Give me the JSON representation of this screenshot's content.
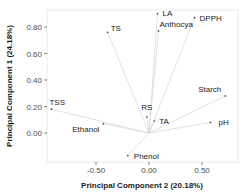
{
  "chart_data": {
    "type": "scatter",
    "subtype": "pca-loading-biplot",
    "title": "",
    "xlabel": "Principal Component 2 (20.18%)",
    "ylabel": "Principal Component 1 (24.18%)",
    "xlim": [
      -0.98,
      0.84
    ],
    "ylim": [
      -0.22,
      0.93
    ],
    "xticks": [
      -0.5,
      0.0,
      0.5
    ],
    "xtick_labels": [
      "-0.50",
      "0.00",
      "0.50"
    ],
    "yticks": [
      0.0,
      0.2,
      0.4,
      0.6,
      0.8
    ],
    "ytick_labels": [
      "0.00",
      "0.20",
      "0.40",
      "0.60",
      "0.80"
    ],
    "grid": false,
    "legend": null,
    "vectors_from_origin": true,
    "points": [
      {
        "label": "TS",
        "x": -0.39,
        "y": 0.76,
        "label_dx": 3,
        "label_dy": -1,
        "anchor": "start"
      },
      {
        "label": "LA",
        "x": 0.08,
        "y": 0.9,
        "label_dx": 5,
        "label_dy": 2,
        "anchor": "start"
      },
      {
        "label": "Anthocya",
        "x": 0.09,
        "y": 0.77,
        "label_dx": 1,
        "label_dy": -4,
        "anchor": "start"
      },
      {
        "label": "DPPH",
        "x": 0.43,
        "y": 0.87,
        "label_dx": 5,
        "label_dy": 3,
        "anchor": "start"
      },
      {
        "label": "TSS",
        "x": -0.92,
        "y": 0.18,
        "label_dx": -2,
        "label_dy": -4,
        "anchor": "start"
      },
      {
        "label": "Ethanol",
        "x": -0.43,
        "y": 0.07,
        "label_dx": -4,
        "label_dy": 8,
        "anchor": "end"
      },
      {
        "label": "RS",
        "x": -0.02,
        "y": 0.12,
        "label_dx": 0,
        "label_dy": -7,
        "anchor": "middle"
      },
      {
        "label": "TA",
        "x": 0.05,
        "y": 0.09,
        "label_dx": 5,
        "label_dy": 3,
        "anchor": "start"
      },
      {
        "label": "Starch",
        "x": 0.72,
        "y": 0.28,
        "label_dx": -4,
        "label_dy": -4,
        "anchor": "end"
      },
      {
        "label": "pH",
        "x": 0.58,
        "y": 0.08,
        "label_dx": 8,
        "label_dy": 3,
        "anchor": "start"
      },
      {
        "label": "Phenol",
        "x": -0.2,
        "y": -0.17,
        "label_dx": 6,
        "label_dy": 3,
        "anchor": "start"
      }
    ],
    "colors": {
      "point": "#555555",
      "vector": "#d9d9d9",
      "panel_border": "#ebebeb",
      "axis_text": "#4d4d4d",
      "title_text": "#1a1a1a"
    }
  }
}
